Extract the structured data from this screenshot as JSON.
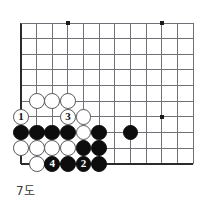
{
  "figure": {
    "kind": "go-board-diagram",
    "caption": "7도",
    "board": {
      "origin_x": 21,
      "origin_y": 23,
      "spacing": 15.65,
      "cols": 12,
      "rows": 10,
      "line_color": "#6e7277",
      "edge_color": "#2b2b2b",
      "edge_width": 2.0,
      "line_width": 1.0,
      "star_color": "#1a1a1a",
      "star_radius": 2.2,
      "star_points": [
        {
          "col": 4,
          "row": 1
        },
        {
          "col": 10,
          "row": 1
        },
        {
          "col": 10,
          "row": 7
        }
      ]
    },
    "colors": {
      "black_stone": "#0d0d0d",
      "white_stone": "#ffffff",
      "white_outline": "#55585c",
      "background": "#ffffff",
      "caption_text": "#3a3a3a"
    },
    "stone_radius": 7.9,
    "stones": [
      {
        "id": "w-c2-r6",
        "color": "white",
        "col": 2,
        "row": 6,
        "label": ""
      },
      {
        "id": "w-c3-r6",
        "color": "white",
        "col": 3,
        "row": 6,
        "label": ""
      },
      {
        "id": "w-c4-r6",
        "color": "white",
        "col": 4,
        "row": 6,
        "label": ""
      },
      {
        "id": "w-c1-r7",
        "color": "white",
        "col": 1,
        "row": 7,
        "label": "1"
      },
      {
        "id": "w-c4-r7",
        "color": "white",
        "col": 4,
        "row": 7,
        "label": "3"
      },
      {
        "id": "w-c5-r7",
        "color": "white",
        "col": 5,
        "row": 7,
        "label": ""
      },
      {
        "id": "b-c1-r8",
        "color": "black",
        "col": 1,
        "row": 8,
        "label": ""
      },
      {
        "id": "b-c2-r8",
        "color": "black",
        "col": 2,
        "row": 8,
        "label": ""
      },
      {
        "id": "b-c3-r8",
        "color": "black",
        "col": 3,
        "row": 8,
        "label": ""
      },
      {
        "id": "b-c4-r8",
        "color": "black",
        "col": 4,
        "row": 8,
        "label": ""
      },
      {
        "id": "w-c5-r8",
        "color": "white",
        "col": 5,
        "row": 8,
        "label": ""
      },
      {
        "id": "b-c6-r8",
        "color": "black",
        "col": 6,
        "row": 8,
        "label": ""
      },
      {
        "id": "b-c8-r8",
        "color": "black",
        "col": 8,
        "row": 8,
        "label": ""
      },
      {
        "id": "w-c1-r9",
        "color": "white",
        "col": 1,
        "row": 9,
        "label": ""
      },
      {
        "id": "w-c2-r9",
        "color": "white",
        "col": 2,
        "row": 9,
        "label": ""
      },
      {
        "id": "w-c3-r9",
        "color": "white",
        "col": 3,
        "row": 9,
        "label": ""
      },
      {
        "id": "w-c4-r9",
        "color": "white",
        "col": 4,
        "row": 9,
        "label": ""
      },
      {
        "id": "b-c5-r9",
        "color": "black",
        "col": 5,
        "row": 9,
        "label": ""
      },
      {
        "id": "b-c6-r9",
        "color": "black",
        "col": 6,
        "row": 9,
        "label": ""
      },
      {
        "id": "w-c2-r10",
        "color": "white",
        "col": 2,
        "row": 10,
        "label": ""
      },
      {
        "id": "b-c3-r10",
        "color": "black",
        "col": 3,
        "row": 10,
        "label": "4"
      },
      {
        "id": "b-c4-r10",
        "color": "black",
        "col": 4,
        "row": 10,
        "label": ""
      },
      {
        "id": "b-c5-r10",
        "color": "black",
        "col": 5,
        "row": 10,
        "label": "2"
      },
      {
        "id": "b-c6-r10",
        "color": "black",
        "col": 6,
        "row": 10,
        "label": ""
      }
    ],
    "move_sequence": [
      {
        "number": "1",
        "color": "white"
      },
      {
        "number": "2",
        "color": "black"
      },
      {
        "number": "3",
        "color": "white"
      },
      {
        "number": "4",
        "color": "black"
      }
    ]
  }
}
